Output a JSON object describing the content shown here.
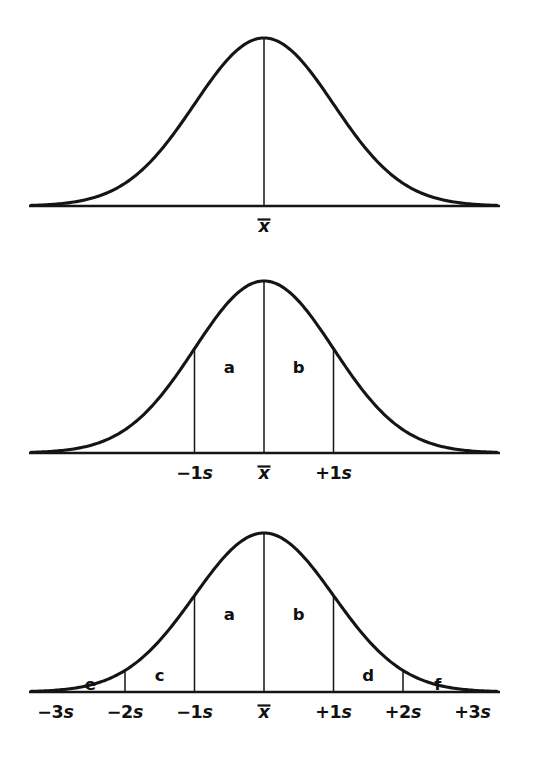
{
  "figure": {
    "background_color": "#ffffff",
    "ink_color": "#151515"
  },
  "symbols": {
    "mean": "x",
    "mean_label": "x-bar",
    "overbar": "̄"
  },
  "panels": [
    {
      "id": "panel-1",
      "name": "plain-normal-curve",
      "center_line": true,
      "tick_labels": [
        {
          "value": 0,
          "text": "x",
          "type": "mean"
        }
      ],
      "area_labels": [],
      "dividers": []
    },
    {
      "id": "panel-2",
      "name": "normal-curve-one-sigma",
      "center_line": true,
      "tick_labels": [
        {
          "value": -1,
          "sign": "−",
          "number": "1",
          "unit": "s",
          "text": "−1s"
        },
        {
          "value": 0,
          "text": "x",
          "type": "mean"
        },
        {
          "value": 1,
          "sign": "+",
          "number": "1",
          "unit": "s",
          "text": "+1s"
        }
      ],
      "area_labels": [
        {
          "label": "a",
          "from": -1,
          "to": 0
        },
        {
          "label": "b",
          "from": 0,
          "to": 1
        }
      ],
      "dividers": [
        -1,
        1
      ]
    },
    {
      "id": "panel-3",
      "name": "normal-curve-three-sigma",
      "center_line": true,
      "tick_labels": [
        {
          "value": -3,
          "sign": "−",
          "number": "3",
          "unit": "s",
          "text": "−3s"
        },
        {
          "value": -2,
          "sign": "−",
          "number": "2",
          "unit": "s",
          "text": "−2s"
        },
        {
          "value": -1,
          "sign": "−",
          "number": "1",
          "unit": "s",
          "text": "−1s"
        },
        {
          "value": 0,
          "text": "x",
          "type": "mean"
        },
        {
          "value": 1,
          "sign": "+",
          "number": "1",
          "unit": "s",
          "text": "+1s"
        },
        {
          "value": 2,
          "sign": "+",
          "number": "2",
          "unit": "s",
          "text": "+2s"
        },
        {
          "value": 3,
          "sign": "+",
          "number": "3",
          "unit": "s",
          "text": "+3s"
        }
      ],
      "area_labels": [
        {
          "label": "e",
          "from": -3,
          "to": -2
        },
        {
          "label": "c",
          "from": -2,
          "to": -1
        },
        {
          "label": "a",
          "from": -1,
          "to": 0
        },
        {
          "label": "b",
          "from": 0,
          "to": 1
        },
        {
          "label": "d",
          "from": 1,
          "to": 2
        },
        {
          "label": "f",
          "from": 2,
          "to": 3
        }
      ],
      "dividers": [
        -3,
        -2,
        -1,
        1,
        2,
        3
      ]
    }
  ],
  "chart_data": {
    "type": "line",
    "xlabel": "",
    "ylabel": "",
    "xlim": [
      -3.35,
      3.35
    ],
    "ylim": [
      0,
      1
    ],
    "grid": false,
    "legend": null,
    "function": "gaussian: y = exp(-x^2 / 2)",
    "x_tick_values": [
      -3,
      -2,
      -1,
      0,
      1,
      2,
      3
    ],
    "x_tick_labels": [
      "−3s",
      "−2s",
      "−1s",
      "x̄",
      "+1s",
      "+2s",
      "+3s"
    ],
    "series": [
      {
        "name": "panel-1-curve",
        "x": [
          -3.35,
          -3,
          -2.5,
          -2,
          -1.5,
          -1,
          -0.5,
          0,
          0.5,
          1,
          1.5,
          2,
          2.5,
          3,
          3.35
        ],
        "values": [
          0.004,
          0.011,
          0.044,
          0.135,
          0.325,
          0.607,
          0.882,
          1.0,
          0.882,
          0.607,
          0.325,
          0.135,
          0.044,
          0.011,
          0.004
        ]
      },
      {
        "name": "panel-2-curve",
        "x": [
          -3.35,
          -3,
          -2.5,
          -2,
          -1.5,
          -1,
          -0.5,
          0,
          0.5,
          1,
          1.5,
          2,
          2.5,
          3,
          3.35
        ],
        "values": [
          0.004,
          0.011,
          0.044,
          0.135,
          0.325,
          0.607,
          0.882,
          1.0,
          0.882,
          0.607,
          0.325,
          0.135,
          0.044,
          0.011,
          0.004
        ]
      },
      {
        "name": "panel-3-curve",
        "x": [
          -3.35,
          -3,
          -2.5,
          -2,
          -1.5,
          -1,
          -0.5,
          0,
          0.5,
          1,
          1.5,
          2,
          2.5,
          3,
          3.35
        ],
        "values": [
          0.004,
          0.011,
          0.044,
          0.135,
          0.325,
          0.607,
          0.882,
          1.0,
          0.882,
          0.607,
          0.325,
          0.135,
          0.044,
          0.011,
          0.004
        ]
      }
    ],
    "annotations": [
      {
        "panel": 2,
        "label": "a",
        "region": "−1s to x̄"
      },
      {
        "panel": 2,
        "label": "b",
        "region": "x̄ to +1s"
      },
      {
        "panel": 3,
        "label": "a",
        "region": "−1s to x̄"
      },
      {
        "panel": 3,
        "label": "b",
        "region": "x̄ to +1s"
      },
      {
        "panel": 3,
        "label": "c",
        "region": "−2s to −1s"
      },
      {
        "panel": 3,
        "label": "d",
        "region": "+1s to +2s"
      },
      {
        "panel": 3,
        "label": "e",
        "region": "−3s to −2s"
      },
      {
        "panel": 3,
        "label": "f",
        "region": "+2s to +3s"
      }
    ]
  }
}
